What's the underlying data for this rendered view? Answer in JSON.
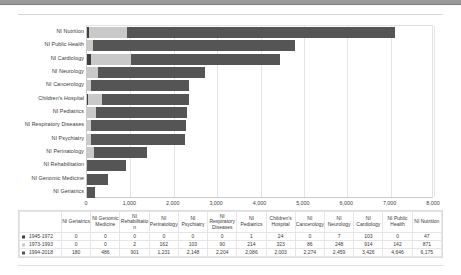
{
  "chart_data": {
    "type": "bar",
    "orientation": "horizontal",
    "stacked": true,
    "title": "",
    "xlabel": "",
    "ylabel": "",
    "xlim": [
      0,
      8000
    ],
    "xticks": [
      "0",
      "1,000",
      "2,000",
      "3,000",
      "4,000",
      "5,000",
      "6,000",
      "7,000",
      "8,000"
    ],
    "grid": true,
    "legend_position": "table-row-headers",
    "categories": [
      "NI Nutrition",
      "NI Public Health",
      "NI Cardiology",
      "NI Neurology",
      "NI Cancerology",
      "Children's Hospital",
      "NI Pediatrics",
      "NI Respiratory Diseases",
      "NI Psychiatry",
      "NI Perinatology",
      "NI Rehabilitation",
      "NI Genomic Medicine",
      "NI Geriatrics"
    ],
    "series": [
      {
        "name": "1945-1972",
        "color": "#3f3f3f",
        "values": [
          47,
          0,
          103,
          7,
          0,
          24,
          1,
          0,
          0,
          0,
          0,
          0,
          0
        ]
      },
      {
        "name": "1973-1993",
        "color": "#c9c9c9",
        "values": [
          871,
          142,
          914,
          248,
          86,
          323,
          214,
          90,
          103,
          162,
          2,
          0,
          0
        ]
      },
      {
        "name": "1994-2018",
        "color": "#555555",
        "values": [
          6175,
          4646,
          3426,
          2459,
          2274,
          2003,
          2086,
          2204,
          2148,
          1231,
          901,
          486,
          180
        ]
      }
    ]
  },
  "table": {
    "corner_label": "",
    "columns": [
      "NI Geriatrics",
      "NI Genomic Medicine",
      "NI Rehabilitatio n",
      "NI Perinatology",
      "NI Psychiatry",
      "NI Respiratory Diseases",
      "NI Pediatrics",
      "Children's Hospital",
      "NI Cancerology",
      "NI Neurology",
      "NI Cardiology",
      "NI Public Health",
      "NI Nutrition"
    ],
    "rows": [
      {
        "label": "1945-1972",
        "marker_color": "#3f3f3f",
        "values": [
          "0",
          "0",
          "0",
          "0",
          "0",
          "0",
          "1",
          "24",
          "0",
          "7",
          "103",
          "0",
          "47"
        ]
      },
      {
        "label": "1973-1993",
        "marker_color": "#c9c9c9",
        "values": [
          "0",
          "0",
          "2",
          "162",
          "103",
          "90",
          "214",
          "323",
          "86",
          "248",
          "914",
          "142",
          "871"
        ]
      },
      {
        "label": "1994-2018",
        "marker_color": "#555555",
        "values": [
          "180",
          "486",
          "901",
          "1,231",
          "2,148",
          "2,204",
          "2,086",
          "2,003",
          "2,274",
          "2,459",
          "3,426",
          "4,646",
          "6,175"
        ]
      }
    ]
  }
}
